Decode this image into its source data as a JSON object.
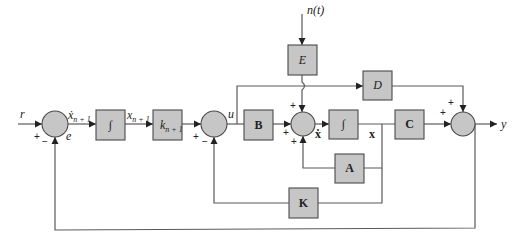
{
  "diagram": {
    "type": "block-diagram",
    "inputs": {
      "reference": "r",
      "disturbance": "n(t)"
    },
    "output": "y",
    "signals": {
      "error": "e",
      "integrator_input": "ẋ",
      "integrator_input_sub": "n + 1",
      "integrator_state": "x",
      "integrator_state_sub": "n + 1",
      "control": "u",
      "state_derivative": "ẋ",
      "state": "x"
    },
    "blocks": {
      "integrator_1": "∫",
      "gain_k": "k",
      "gain_k_sub": "n + 1",
      "B": "B",
      "integrator_2": "∫",
      "C": "C",
      "D": "D",
      "E": "E",
      "A": "A",
      "K": "K"
    },
    "summing_junctions": [
      {
        "id": "sum-error",
        "signs": [
          "+",
          "−"
        ]
      },
      {
        "id": "sum-control",
        "signs": [
          "+",
          "−"
        ]
      },
      {
        "id": "sum-state",
        "signs": [
          "+",
          "+",
          "+"
        ]
      },
      {
        "id": "sum-output",
        "signs": [
          "+",
          "+"
        ]
      }
    ],
    "colors": {
      "block_fill": "#c6c6c6",
      "block_stroke": "#4a4a4a",
      "wire": "#5a5a5a",
      "background": "#ffffff"
    }
  }
}
